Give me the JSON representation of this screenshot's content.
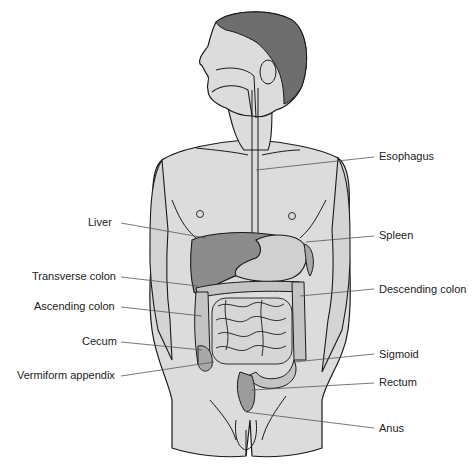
{
  "diagram": {
    "colors": {
      "skin": "#dcdcdc",
      "outline": "#1a1a1a",
      "hair": "#6e6e6e",
      "organ_dark": "#8c8c8c",
      "organ_mid": "#a8a8a8",
      "organ_light": "#d0d0d0",
      "leader_line": "#555555",
      "text": "#222222"
    },
    "labels_left": [
      {
        "id": "liver",
        "text": "Liver"
      },
      {
        "id": "transverse-colon",
        "text": "Transverse colon"
      },
      {
        "id": "ascending-colon",
        "text": "Ascending colon"
      },
      {
        "id": "cecum",
        "text": "Cecum"
      },
      {
        "id": "vermiform-appendix",
        "text": "Vermiform appendix"
      }
    ],
    "labels_right": [
      {
        "id": "esophagus",
        "text": "Esophagus"
      },
      {
        "id": "spleen",
        "text": "Spleen"
      },
      {
        "id": "descending-colon",
        "text": "Descending colon"
      },
      {
        "id": "sigmoid",
        "text": "Sigmoid"
      },
      {
        "id": "rectum",
        "text": "Rectum"
      },
      {
        "id": "anus",
        "text": "Anus"
      }
    ]
  }
}
